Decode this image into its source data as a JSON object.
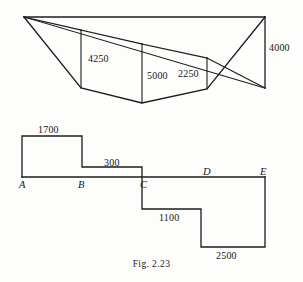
{
  "figure": {
    "caption": "Fig. 2.23",
    "upper_diagram": {
      "name": "cross-section-diagram",
      "dimension_labels": [
        {
          "id": "d4250",
          "text": "4250",
          "x": 88,
          "y": 53
        },
        {
          "id": "d5000",
          "text": "5000",
          "x": 147,
          "y": 70
        },
        {
          "id": "d2250",
          "text": "2250",
          "x": 178,
          "y": 68
        },
        {
          "id": "d4000",
          "text": "4000",
          "x": 269,
          "y": 42
        }
      ],
      "geometry": {
        "apex_left": [
          24,
          17
        ],
        "apex_right": [
          265,
          17
        ],
        "right_vertical_bottom": [
          265,
          88
        ],
        "offsets": [
          {
            "label": "4250",
            "x": 81,
            "top_y": 30,
            "bottom_y": 88
          },
          {
            "label": "5000",
            "x": 142,
            "top_y": 44,
            "bottom_y": 103
          },
          {
            "label": "2250",
            "x": 207,
            "top_y": 58,
            "bottom_y": 89
          }
        ],
        "ground_line": [
          [
            24,
            17
          ],
          [
            265,
            17
          ]
        ],
        "section_outline": [
          [
            24,
            17
          ],
          [
            81,
            88
          ],
          [
            142,
            103
          ],
          [
            207,
            89
          ],
          [
            265,
            17
          ]
        ],
        "survey_line": [
          [
            24,
            17
          ],
          [
            265,
            88
          ]
        ]
      }
    },
    "lower_diagram": {
      "name": "step-profile-diagram",
      "dimension_labels": [
        {
          "id": "s1700",
          "text": "1700",
          "x": 38,
          "y": 124
        },
        {
          "id": "s300",
          "text": "300",
          "x": 104,
          "y": 157
        },
        {
          "id": "s1100",
          "text": "1100",
          "x": 159,
          "y": 212
        },
        {
          "id": "s2500",
          "text": "2500",
          "x": 216,
          "y": 250
        }
      ],
      "point_labels": [
        {
          "id": "ptA",
          "text": "A",
          "x": 19,
          "y": 179
        },
        {
          "id": "ptB",
          "text": "B",
          "x": 78,
          "y": 179
        },
        {
          "id": "ptC",
          "text": "C",
          "x": 140,
          "y": 179
        },
        {
          "id": "ptD",
          "text": "D",
          "x": 203,
          "y": 166
        },
        {
          "id": "ptE",
          "text": "E",
          "x": 260,
          "y": 166
        }
      ],
      "geometry": {
        "baseline": [
          [
            22,
            177
          ],
          [
            265,
            177
          ]
        ],
        "step_path": [
          [
            22,
            177
          ],
          [
            22,
            136
          ],
          [
            82,
            136
          ],
          [
            82,
            167
          ],
          [
            142,
            167
          ],
          [
            142,
            209
          ],
          [
            201,
            209
          ],
          [
            201,
            247
          ],
          [
            265,
            247
          ],
          [
            265,
            177
          ]
        ]
      }
    }
  },
  "style": {
    "line_color": "#1c1c1c",
    "text_color": "#161616",
    "background": "#fdfdfb"
  }
}
